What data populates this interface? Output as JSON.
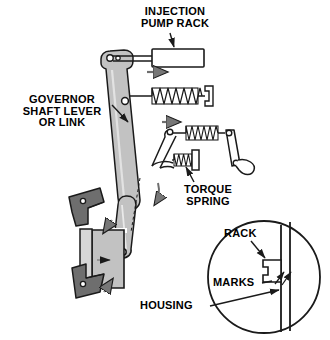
{
  "figure": {
    "type": "mechanical-linkage-diagram",
    "background_color": "#ffffff",
    "line_color": "#1a1a1a",
    "fill_light_gray": "#c9c9c9",
    "fill_mid_gray": "#b5b5b5",
    "fill_dark_gray": "#6e6e6e",
    "fill_white": "#ffffff"
  },
  "labels": {
    "injection_pump_rack": "INJECTION\nPUMP RACK",
    "governor_shaft_lever_or_link": "GOVERNOR\nSHAFT LEVER\nOR LINK",
    "torque_spring": "TORQUE\nSPRING",
    "housing": "HOUSING",
    "rack": "RACK",
    "marks": "MARKS"
  },
  "parts": {
    "injection_pump_rack_block": "rack-block",
    "governor_lever": "long-tapered-lever",
    "return_spring_upper": "coil-spring-upper",
    "return_spring_mid": "coil-spring-middle",
    "torque_spring_small": "coil-spring-small-with-cap",
    "bellcrank": "bellcrank-link",
    "governor_housing": "housing-body",
    "mounting_brackets": [
      "bracket-upper",
      "bracket-lower"
    ],
    "detail_circle": "magnified-detail-view"
  },
  "motion_arrows": {
    "rack_travel": "right",
    "mid_travel": "right",
    "lever_swing": "down-right",
    "housing_internal": "right",
    "bracket_upper": "down-left",
    "bracket_lower": "up-left"
  },
  "leader_lines": {
    "injection_pump_rack": "from label down-right to rack block",
    "governor_shaft_lever_or_link": "from label down-right to lever body",
    "torque_spring": "from label up to small spring cap",
    "housing": "from label right to housing wall in detail circle",
    "rack": "from label down-right to rack tab in detail circle",
    "marks": "from label up-right to scribe marks in detail circle"
  }
}
